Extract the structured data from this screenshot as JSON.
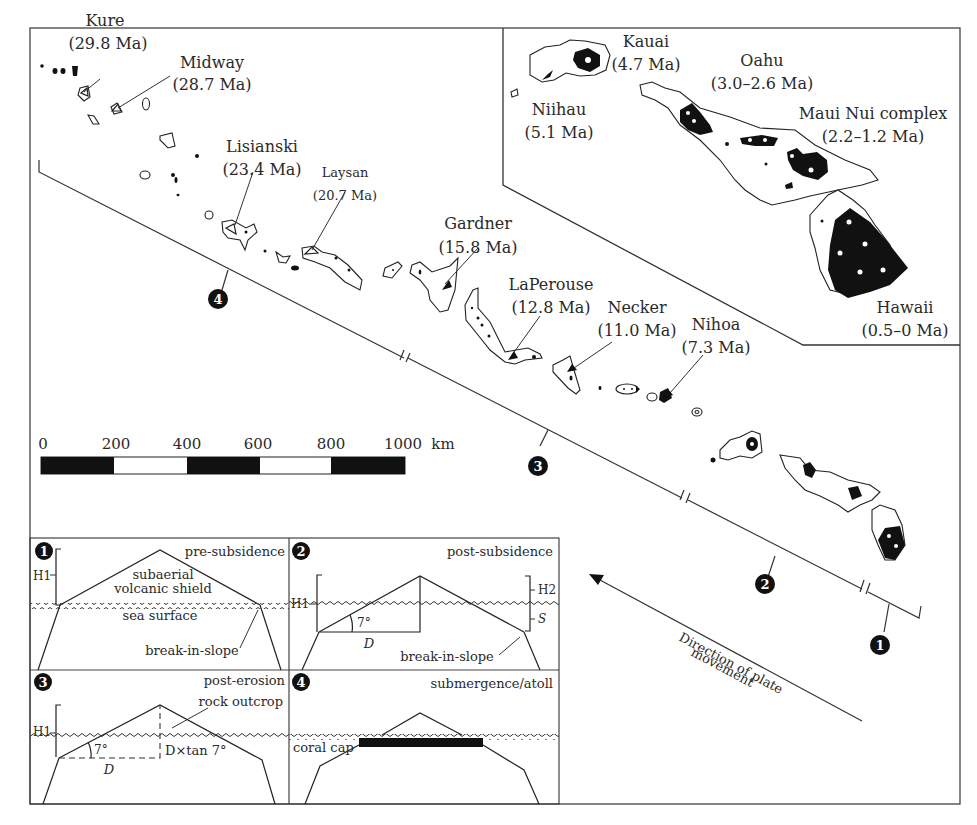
{
  "figure": {
    "islands": [
      {
        "name": "Kure",
        "age": "(29.8 Ma)"
      },
      {
        "name": "Midway",
        "age": "(28.7 Ma)"
      },
      {
        "name": "Lisianski",
        "age": "(23.4 Ma)"
      },
      {
        "name": "Laysan",
        "age": "(20.7 Ma)"
      },
      {
        "name": "Gardner",
        "age": "(15.8 Ma)"
      },
      {
        "name": "LaPerouse",
        "age": "(12.8 Ma)"
      },
      {
        "name": "Necker",
        "age": "(11.0 Ma)"
      },
      {
        "name": "Nihoa",
        "age": "(7.3 Ma)"
      }
    ],
    "inset": {
      "islands": [
        {
          "name": "Kauai",
          "age": "(4.7 Ma)"
        },
        {
          "name": "Niihau",
          "age": "(5.1 Ma)"
        },
        {
          "name": "Oahu",
          "age": "(3.0–2.6 Ma)"
        },
        {
          "name": "Maui Nui complex",
          "age": "(2.2–1.2 Ma)"
        },
        {
          "name": "Hawaii",
          "age": "(0.5–0 Ma)"
        }
      ]
    },
    "scale_bar": {
      "ticks": [
        "0",
        "200",
        "400",
        "600",
        "800",
        "1000"
      ],
      "unit": "km"
    },
    "stage_markers": [
      "1",
      "2",
      "3",
      "4"
    ],
    "plate_arrow": {
      "line1": "Direction of plate",
      "line2": "movement"
    },
    "panels": [
      {
        "number": "1",
        "title": "pre-subsidence",
        "labels": {
          "h1": "H1",
          "shield1": "subaerial",
          "shield2": "volcanic shield",
          "sea": "sea surface",
          "break": "break-in-slope"
        }
      },
      {
        "number": "2",
        "title": "post-subsidence",
        "labels": {
          "h1": "H1",
          "h2": "H2",
          "s": "S",
          "angle": "7°",
          "d": "D",
          "break": "break-in-slope"
        }
      },
      {
        "number": "3",
        "title": "post-erosion",
        "labels": {
          "h1": "H1",
          "rock": "rock outcrop",
          "angle": "7°",
          "d": "D",
          "dtan": "D×tan 7°"
        }
      },
      {
        "number": "4",
        "title": "submergence/atoll",
        "labels": {
          "coral": "coral cap"
        }
      }
    ]
  }
}
